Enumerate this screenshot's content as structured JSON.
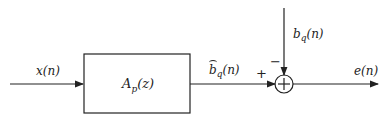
{
  "diagram": {
    "type": "block-diagram",
    "input": {
      "label": "x(n)"
    },
    "block": {
      "label": "A_p(z)",
      "label_main": "A",
      "label_sub": "p",
      "label_arg": "(z)"
    },
    "block_output": {
      "label": "b̂_q(n)",
      "label_main": "b",
      "label_sub": "q",
      "label_arg": "(n)"
    },
    "reference_input": {
      "label": "b_q(n)",
      "label_main": "b",
      "label_sub": "q",
      "label_arg": "(n)"
    },
    "summing_junction": {
      "symbol": "+",
      "plus_sign": "+",
      "minus_sign": "−"
    },
    "output": {
      "label": "e(n)"
    },
    "colors": {
      "line": "#222222",
      "background": "#ffffff"
    }
  }
}
